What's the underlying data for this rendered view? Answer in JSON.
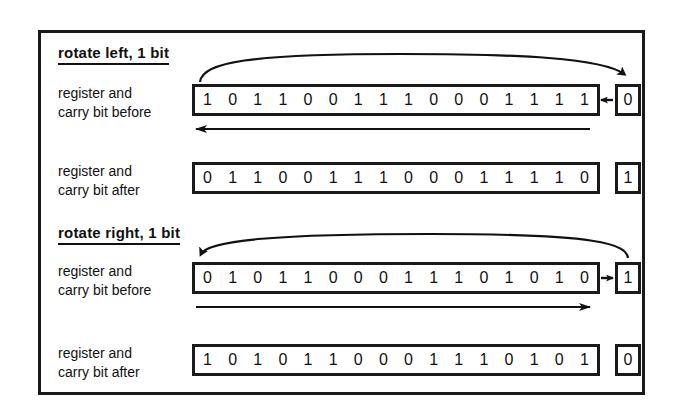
{
  "figure": {
    "frame_color": "#1a1a1a",
    "background": "#ffffff"
  },
  "sections": {
    "left": {
      "heading": "rotate left, 1 bit",
      "before": {
        "label_line1": "register and",
        "label_line2": "carry bit before",
        "bits": [
          "1",
          "0",
          "1",
          "1",
          "0",
          "0",
          "1",
          "1",
          "1",
          "0",
          "0",
          "0",
          "1",
          "1",
          "1",
          "1"
        ],
        "carry": "0"
      },
      "after": {
        "label_line1": "register and",
        "label_line2": "carry bit after",
        "bits": [
          "0",
          "1",
          "1",
          "0",
          "0",
          "1",
          "1",
          "1",
          "0",
          "0",
          "0",
          "1",
          "1",
          "1",
          "1",
          "0"
        ],
        "carry": "1"
      },
      "arc_direction": "left-to-carry",
      "shift_arrow_direction": "left"
    },
    "right": {
      "heading": "rotate right, 1 bit",
      "before": {
        "label_line1": "register and",
        "label_line2": "carry bit before",
        "bits": [
          "0",
          "1",
          "0",
          "1",
          "1",
          "0",
          "0",
          "0",
          "1",
          "1",
          "1",
          "0",
          "1",
          "0",
          "1",
          "0"
        ],
        "carry": "1"
      },
      "after": {
        "label_line1": "register and",
        "label_line2": "carry bit after",
        "bits": [
          "1",
          "0",
          "1",
          "0",
          "1",
          "1",
          "0",
          "0",
          "0",
          "1",
          "1",
          "1",
          "0",
          "1",
          "0",
          "1"
        ],
        "carry": "0"
      },
      "arc_direction": "carry-to-left",
      "shift_arrow_direction": "right"
    }
  },
  "icons": {
    "arc_left": "rotate-left-arc-icon",
    "arc_right": "rotate-right-arc-icon",
    "shift_left": "shift-left-arrow-icon",
    "shift_right": "shift-right-arrow-icon",
    "connector": "register-carry-connector-icon"
  }
}
